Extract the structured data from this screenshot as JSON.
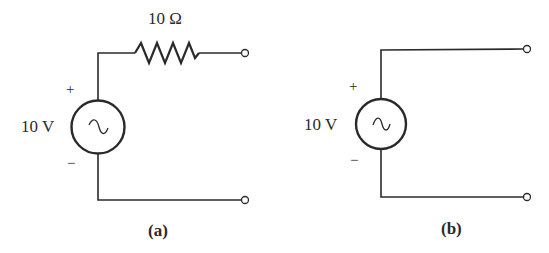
{
  "circuits": [
    {
      "id": "a",
      "caption": "(a)",
      "source": {
        "label": "10 V",
        "type": "ac-voltage-source",
        "plus": "+",
        "minus": "−",
        "symbol": "∿"
      },
      "resistor": {
        "label": "10 Ω"
      },
      "terminals": 2
    },
    {
      "id": "b",
      "caption": "(b)",
      "source": {
        "label": "10 V",
        "type": "ac-voltage-source",
        "plus": "+",
        "minus": "−",
        "symbol": "∿"
      },
      "terminals": 2
    }
  ],
  "colors": {
    "line": "#2a2a2a",
    "background": "#ffffff"
  }
}
